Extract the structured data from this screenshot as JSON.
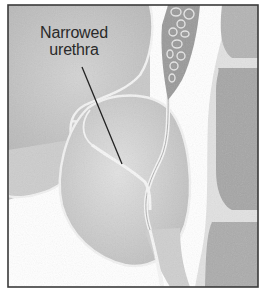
{
  "figure": {
    "label": {
      "line1": "Narrowed",
      "line2": "urethra"
    },
    "colors": {
      "background": "#ffffff",
      "frame": "#3a3a3a",
      "tissue_light": "#d6d6d6",
      "tissue_mid": "#c4c4c4",
      "tissue_dark": "#a8a8a8",
      "outline": "#f4f4f4",
      "leader_line": "#222222",
      "text": "#2a2a2a"
    }
  }
}
